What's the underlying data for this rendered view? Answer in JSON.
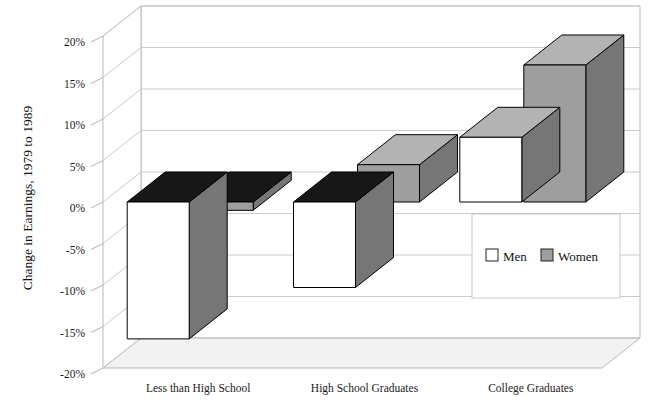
{
  "chart_data": {
    "type": "bar",
    "title": "",
    "subtitle": "",
    "xlabel": "",
    "ylabel": "Change in Earnings, 1979 to 1989",
    "categories": [
      "Less than High School",
      "High School Graduates",
      "College Graduates"
    ],
    "series": [
      {
        "name": "Men",
        "values": [
          -16.5,
          -10.3,
          7.8
        ],
        "color": "#ffffff"
      },
      {
        "name": "Women",
        "values": [
          -1.0,
          4.5,
          16.5
        ],
        "color": "#9e9e9e"
      }
    ],
    "ylim": [
      -20,
      20
    ],
    "ytick_step": 5,
    "ytick_labels": [
      "20%",
      "15%",
      "10%",
      "5%",
      "0%",
      "-5%",
      "-10%",
      "-15%",
      "-20%"
    ],
    "ytick_values": [
      20,
      15,
      10,
      5,
      0,
      -5,
      -10,
      -15,
      -20
    ],
    "grid": true,
    "grid_axis": "y",
    "legend": {
      "position": "inside-right",
      "orientation": "horizontal",
      "entries": [
        {
          "label": "Men",
          "swatch": "#ffffff"
        },
        {
          "label": "Women",
          "swatch": "#9e9e9e"
        }
      ]
    },
    "style": {
      "three_d": true,
      "bar_top_negative_fill": "#171717",
      "bar_side_fill": "#767676",
      "bar_front_men": "#ffffff",
      "bar_front_women": "#9e9e9e",
      "bar_outline": "#000000",
      "wall_fill": "#ffffff",
      "wall_edge": "#b9b9b9",
      "floor_fill": "#f2f2f2",
      "gridline_color": "#cccccc"
    }
  }
}
